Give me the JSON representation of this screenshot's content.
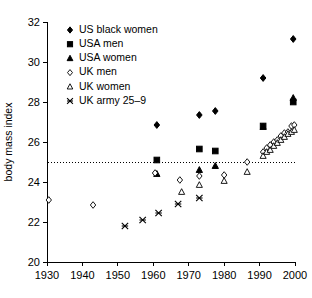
{
  "chart_data": {
    "type": "scatter",
    "title": "",
    "xlabel": "",
    "ylabel": "body mass index",
    "xlim": [
      1930,
      2000
    ],
    "ylim": [
      20,
      32
    ],
    "xticks": [
      1930,
      1940,
      1950,
      1960,
      1970,
      1980,
      1990,
      2000
    ],
    "yticks": [
      20,
      22,
      24,
      26,
      28,
      30,
      32
    ],
    "grid": false,
    "legend_position": "top-left",
    "reference_line": {
      "y": 25,
      "style": "dotted",
      "label": ""
    },
    "series": [
      {
        "name": "US black women",
        "marker": "filled-diamond",
        "color": "#000000",
        "points": [
          [
            1961,
            26.85
          ],
          [
            1973,
            27.35
          ],
          [
            1977.5,
            27.55
          ],
          [
            1991,
            29.2
          ],
          [
            1999.5,
            31.15
          ]
        ]
      },
      {
        "name": "USA men",
        "marker": "filled-square",
        "color": "#000000",
        "points": [
          [
            1961,
            25.1
          ],
          [
            1973,
            25.65
          ],
          [
            1977.5,
            25.55
          ],
          [
            1991,
            26.8
          ],
          [
            1999.5,
            28.0
          ]
        ]
      },
      {
        "name": "USA women",
        "marker": "filled-triangle",
        "color": "#000000",
        "points": [
          [
            1961,
            24.4
          ],
          [
            1973,
            24.6
          ],
          [
            1977.5,
            24.8
          ],
          [
            1991,
            26.75
          ],
          [
            1999.5,
            28.2
          ]
        ]
      },
      {
        "name": "UK men",
        "marker": "open-diamond",
        "color": "#000000",
        "points": [
          [
            1930.5,
            23.1
          ],
          [
            1943,
            22.85
          ],
          [
            1960.5,
            24.45
          ],
          [
            1967.5,
            24.1
          ],
          [
            1973,
            24.3
          ],
          [
            1980,
            24.35
          ],
          [
            1986.5,
            25.0
          ],
          [
            1991,
            25.5
          ],
          [
            1992,
            25.7
          ],
          [
            1993,
            25.85
          ],
          [
            1994,
            26.0
          ],
          [
            1995,
            26.1
          ],
          [
            1996,
            26.3
          ],
          [
            1997,
            26.45
          ],
          [
            1998,
            26.5
          ],
          [
            1999,
            26.8
          ],
          [
            1999.8,
            26.85
          ]
        ]
      },
      {
        "name": "UK women",
        "marker": "open-triangle",
        "color": "#000000",
        "points": [
          [
            1968,
            23.5
          ],
          [
            1973,
            23.85
          ],
          [
            1980,
            24.05
          ],
          [
            1986.5,
            24.5
          ],
          [
            1991,
            25.3
          ],
          [
            1992,
            25.5
          ],
          [
            1993,
            25.6
          ],
          [
            1994,
            25.8
          ],
          [
            1995,
            25.95
          ],
          [
            1996,
            26.1
          ],
          [
            1997,
            26.25
          ],
          [
            1998,
            26.4
          ],
          [
            1999,
            26.5
          ],
          [
            1999.8,
            26.6
          ]
        ]
      },
      {
        "name": "UK army 25–9",
        "marker": "cross-star",
        "color": "#000000",
        "points": [
          [
            1952,
            21.8
          ],
          [
            1957,
            22.1
          ],
          [
            1961.5,
            22.45
          ],
          [
            1967,
            22.9
          ],
          [
            1973,
            23.2
          ]
        ]
      }
    ]
  },
  "legend": {
    "items": [
      {
        "label": "US black women",
        "marker": "filled-diamond"
      },
      {
        "label": "USA men",
        "marker": "filled-square"
      },
      {
        "label": "USA women",
        "marker": "filled-triangle"
      },
      {
        "label": "UK men",
        "marker": "open-diamond"
      },
      {
        "label": "UK women",
        "marker": "open-triangle"
      },
      {
        "label": "UK army 25–9",
        "marker": "cross-star"
      }
    ]
  },
  "axes": {
    "y_title": "body mass index",
    "x_tick_labels": [
      "1930",
      "1940",
      "1950",
      "1960",
      "1970",
      "1980",
      "1990",
      "2000"
    ],
    "y_tick_labels": [
      "20",
      "22",
      "24",
      "26",
      "28",
      "30",
      "32"
    ]
  }
}
